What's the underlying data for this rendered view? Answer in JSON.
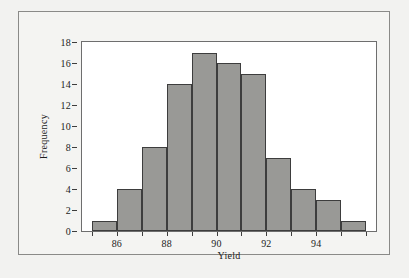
{
  "chart_data": {
    "type": "bar",
    "title": "",
    "subtitle": "",
    "xlabel": "Yield",
    "ylabel": "Frequency",
    "categories": [
      "85-86",
      "86-87",
      "87-88",
      "88-89",
      "89-90",
      "90-91",
      "91-92",
      "92-93",
      "93-94",
      "94-95",
      "95-96"
    ],
    "bin_edges": [
      85,
      86,
      87,
      88,
      89,
      90,
      91,
      92,
      93,
      94,
      95,
      96
    ],
    "values": [
      1,
      4,
      8,
      14,
      17,
      16,
      15,
      7,
      4,
      3,
      1
    ],
    "xlim": [
      84.6,
      96.4
    ],
    "ylim": [
      0,
      18
    ],
    "x_ticks": [
      86,
      88,
      90,
      92,
      94
    ],
    "x_tick_labels": [
      "86",
      "88",
      "90",
      "92",
      "94"
    ],
    "x_minor_ticks": [
      85,
      86,
      87,
      88,
      89,
      90,
      91,
      92,
      93,
      94,
      95,
      96
    ],
    "y_ticks": [
      0,
      2,
      4,
      6,
      8,
      10,
      12,
      14,
      16,
      18
    ],
    "y_tick_labels": [
      "0",
      "2",
      "4",
      "6",
      "8",
      "10",
      "12",
      "14",
      "16",
      "18"
    ],
    "grid": false,
    "legend": false,
    "legend_position": "none",
    "bar_fill_color": "#999996",
    "bar_edge_color": "#3d3d3d",
    "plot_background_color": "#ffffff",
    "figure_background_color": "#f4f4f2",
    "axis_color": "#6e6e6e",
    "text_color": "#1c1c1c"
  }
}
